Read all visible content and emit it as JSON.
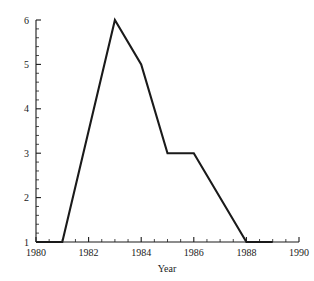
{
  "chart_data": {
    "type": "line",
    "title": "",
    "subtitle": "",
    "xlabel": "Year",
    "ylabel": "",
    "x": [
      1980,
      1981,
      1983,
      1984,
      1985,
      1986,
      1988,
      1989
    ],
    "values": [
      1,
      1,
      6,
      5,
      3,
      3,
      1,
      1
    ],
    "series": [
      {
        "name": "count",
        "x": [
          1980,
          1981,
          1983,
          1984,
          1985,
          1986,
          1988,
          1989
        ],
        "values": [
          1,
          1,
          6,
          5,
          3,
          3,
          1,
          1
        ]
      }
    ],
    "xlim": [
      1980,
      1990
    ],
    "ylim": [
      1,
      6
    ],
    "x_tick_labels": [
      "1980",
      "1982",
      "1984",
      "1986",
      "1988",
      "1990"
    ],
    "x_tick_values": [
      1980,
      1982,
      1984,
      1986,
      1988,
      1990
    ],
    "x_minor_tick_step": 0.5,
    "y_tick_labels": [
      "1",
      "2",
      "3",
      "4",
      "5",
      "6"
    ],
    "y_tick_values": [
      1,
      2,
      3,
      4,
      5,
      6
    ],
    "y_minor_tick_step": 0.2,
    "grid": false,
    "legend": false,
    "legend_position": "none",
    "line_color": "#1a1a1a",
    "axis_color": "#1a1a1a",
    "background_color": "#ffffff",
    "annotations": []
  },
  "axis": {
    "x_title": "Year"
  }
}
